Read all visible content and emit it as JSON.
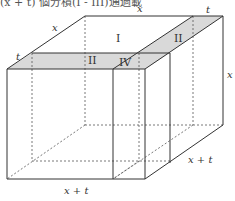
{
  "header": {
    "clipped_text": "(x + t) 個分積(I - III)通過載"
  },
  "figure": {
    "type": "box_volume_decomposition",
    "labels": {
      "top_back_x": "x",
      "top_back_t": "t",
      "left_depth_x": "x",
      "left_depth_t": "t",
      "right_height": "x",
      "bottom_front": "x + t",
      "bottom_right": "x + t"
    },
    "regions": {
      "r1": "I",
      "r2a": "II",
      "r2b": "II",
      "r4": "IV"
    },
    "colors": {
      "shade": "#d9d9d9",
      "line": "#333333",
      "dash": "#555555"
    }
  }
}
